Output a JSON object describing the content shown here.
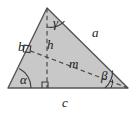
{
  "figure": {
    "kind": "geometry-diagram",
    "shape": "triangle",
    "fill_color": "#c8c8c8",
    "stroke_color": "#555555",
    "dash_color": "#4a4a4a",
    "background_color": "#ffffff",
    "label_color": "#1a1a1a"
  },
  "labels": {
    "side_a": "a",
    "side_b": "b",
    "side_c": "c",
    "altitude_h": "h",
    "median_m": "m",
    "angle_alpha": "α",
    "angle_beta": "β",
    "angle_gamma": "γ"
  },
  "icons": {
    "right_angle_base": "right-angle-marker",
    "right_angle_side_b": "right-angle-marker",
    "arc_alpha": "angle-arc",
    "arc_beta": "angle-arc",
    "arc_gamma": "angle-arc"
  },
  "geometry": {
    "vertex_left": {
      "x": 8,
      "y": 88
    },
    "vertex_right": {
      "x": 128,
      "y": 88
    },
    "vertex_apex": {
      "x": 47,
      "y": 8
    },
    "altitude_foot": {
      "x": 47,
      "y": 88
    },
    "median_foot_on_b": {
      "x": 28,
      "y": 50
    }
  }
}
